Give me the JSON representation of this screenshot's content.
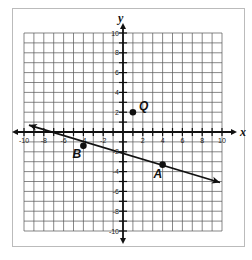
{
  "figure": {
    "axes": {
      "x_label": "x",
      "y_label": "y",
      "x_range": [
        -10,
        10
      ],
      "y_range": [
        -10,
        10
      ],
      "grid_step": 1,
      "x_tick_labels": [
        "-10",
        "-8",
        "-6",
        "-4",
        "-2",
        "2",
        "4",
        "6",
        "8",
        "10"
      ],
      "y_tick_labels": [
        "10",
        "8",
        "6",
        "4",
        "2",
        "-2",
        "-4",
        "-6",
        "-8",
        "-10"
      ]
    },
    "points": [
      {
        "label": "Q",
        "x": 1,
        "y": 2
      },
      {
        "label": "B",
        "x": -4,
        "y": -1.4
      },
      {
        "label": "A",
        "x": 4,
        "y": -3.3
      }
    ],
    "line": {
      "through": [
        "B",
        "A"
      ],
      "from": {
        "x": -9.5,
        "y": 0.7
      },
      "to": {
        "x": 9.8,
        "y": -5.1
      },
      "arrows": "both"
    },
    "colors": {
      "grid": "#555555",
      "axis": "#111111",
      "frame": "#bbbbbb",
      "ink": "#111111"
    }
  }
}
